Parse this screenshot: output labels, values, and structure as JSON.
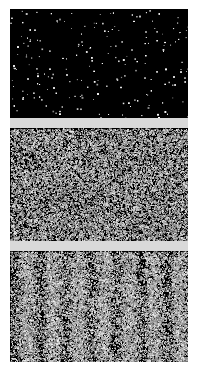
{
  "figure": {
    "name": "single-photon-interference-buildup",
    "background_color": "#ffffff",
    "gap_color": "#d9d9d9",
    "panel_background_color": "#000000",
    "speckle_color": "#ffffff",
    "width": 198,
    "height": 375,
    "panel_left": 10,
    "panel_width": 178
  },
  "panels": [
    {
      "id": "panel-1",
      "label": "",
      "pattern": "sparse-speckle",
      "top": 9,
      "height": 109,
      "point_count": 210,
      "dot_size": 1.25,
      "fringe_visibility": 0.0,
      "fringe_periods": 0,
      "brightness": 1.0,
      "description": "Sparse isolated bright points on a black field"
    },
    {
      "id": "panel-2",
      "label": "",
      "pattern": "dense-speckle",
      "top": 128,
      "height": 113,
      "point_count": 16500,
      "dot_size": 1.0,
      "fringe_visibility": 0.0,
      "fringe_periods": 0,
      "brightness": 0.92,
      "description": "Dense uniform random speckle, no visible fringes"
    },
    {
      "id": "panel-3",
      "label": "",
      "pattern": "fringed-speckle",
      "top": 251,
      "height": 111,
      "point_count": 30000,
      "dot_size": 1.0,
      "fringe_visibility": 0.62,
      "fringe_periods": 7,
      "fringe_phase": 0.35,
      "brightness": 0.95,
      "description": "Dense speckle modulated by vertical interference fringes"
    }
  ],
  "gaps": [
    {
      "id": "gap-1",
      "top": 118,
      "height": 10
    },
    {
      "id": "gap-2",
      "top": 241,
      "height": 10
    }
  ],
  "chart_data": {
    "type": "heatmap",
    "title": "",
    "xlabel": "",
    "ylabel": "",
    "series": [
      {
        "name": "panel-1",
        "pattern": "sparse-speckle",
        "points": 210,
        "fringe_periods": 0,
        "fringe_visibility": 0.0
      },
      {
        "name": "panel-2",
        "pattern": "dense-speckle",
        "points": 16500,
        "fringe_periods": 0,
        "fringe_visibility": 0.0
      },
      {
        "name": "panel-3",
        "pattern": "fringed-speckle",
        "points": 30000,
        "fringe_periods": 7,
        "fringe_visibility": 0.62
      }
    ],
    "legend_position": "none",
    "grid": false
  }
}
